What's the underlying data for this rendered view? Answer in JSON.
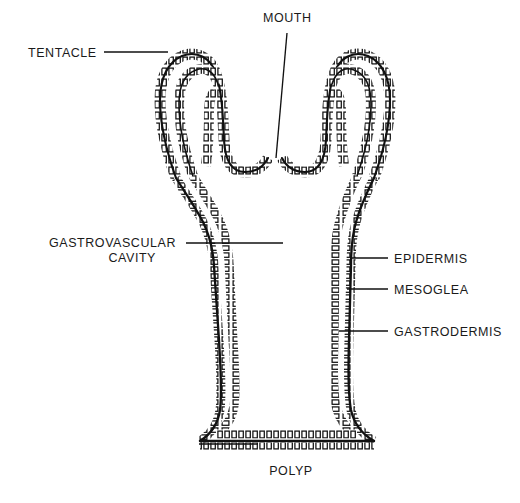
{
  "figure": {
    "title_caption": "POLYP",
    "organism_type": "cnidarian polyp cross-section",
    "background_color": "#ffffff",
    "ink_color": "#111111"
  },
  "labels": [
    {
      "id": "tentacle",
      "text": "TENTACLE",
      "anchor": "start",
      "x": 28,
      "y": 57,
      "interactable": false
    },
    {
      "id": "mouth",
      "text": "MOUTH",
      "anchor": "start",
      "x": 263,
      "y": 22,
      "interactable": false
    },
    {
      "id": "gastrovascular_line1",
      "text": "GASTROVASCULAR",
      "anchor": "end",
      "x": 176,
      "y": 247,
      "interactable": false
    },
    {
      "id": "gastrovascular_line2",
      "text": "CAVITY",
      "anchor": "end",
      "x": 156,
      "y": 262,
      "interactable": false
    },
    {
      "id": "epidermis",
      "text": "EPIDERMIS",
      "anchor": "start",
      "x": 394,
      "y": 263,
      "interactable": false
    },
    {
      "id": "mesoglea",
      "text": "MESOGLEA",
      "anchor": "start",
      "x": 394,
      "y": 294,
      "interactable": false
    },
    {
      "id": "gastrodermis",
      "text": "GASTRODERMIS",
      "anchor": "start",
      "x": 394,
      "y": 336,
      "interactable": false
    },
    {
      "id": "polyp",
      "text": "POLYP",
      "anchor": "middle",
      "x": 291,
      "y": 475,
      "interactable": false
    }
  ],
  "leader_lines": [
    {
      "id": "tentacle-leader",
      "d": "M 104 52 L 168 52"
    },
    {
      "id": "mouth-leader",
      "d": "M 287 33 L 276 158"
    },
    {
      "id": "gastrovascular-leader",
      "d": "M 186 243 L 283 243"
    },
    {
      "id": "epidermis-leader",
      "d": "M 352 258 L 388 258"
    },
    {
      "id": "mesoglea-leader",
      "d": "M 347 289 L 388 289"
    },
    {
      "id": "gastrodermis-leader",
      "d": "M 339 331 L 388 331"
    },
    {
      "id": "polyp-leader",
      "d": "M 199 444 L 258 444"
    }
  ],
  "anatomy": {
    "wall_layers": [
      {
        "name": "epidermis",
        "position": "outer cell row"
      },
      {
        "name": "mesoglea",
        "position": "middle dark band"
      },
      {
        "name": "gastrodermis",
        "position": "inner cell row"
      }
    ],
    "parts": [
      "left tentacle",
      "right tentacle",
      "mouth opening",
      "body column",
      "gastrovascular cavity",
      "basal disc"
    ]
  }
}
